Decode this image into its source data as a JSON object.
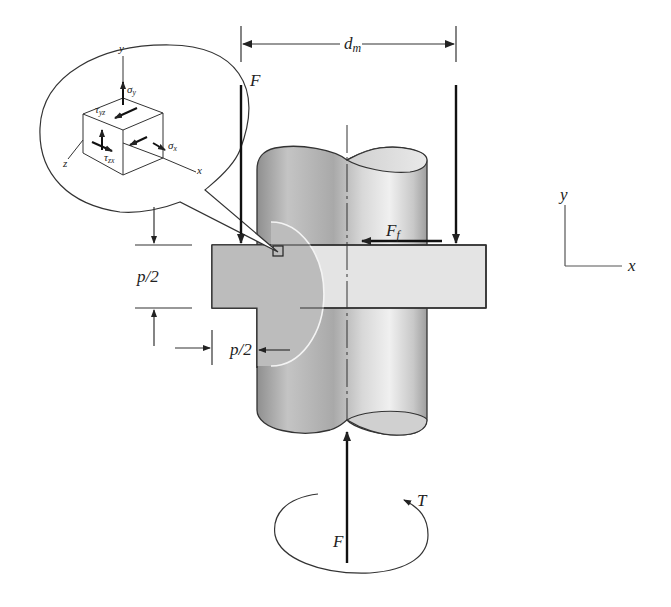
{
  "diagram": {
    "type": "power-screw-thread-stress-element",
    "labels": {
      "pitch_diameter": "d",
      "pitch_diameter_sub": "m",
      "force_top": "F",
      "force_bottom": "F",
      "friction_force": "F",
      "friction_force_sub": "f",
      "torque": "T",
      "pitch_half_vertical": "p/2",
      "pitch_half_horizontal": "p/2",
      "axis_y": "y",
      "axis_x": "x"
    },
    "stress_element": {
      "axis_y": "y",
      "axis_x": "x",
      "axis_z": "z",
      "sigma_y": "σ",
      "sigma_y_sub": "y",
      "sigma_x": "σ",
      "sigma_x_sub": "x",
      "tau_yz": "τ",
      "tau_yz_sub": "yz",
      "tau_zx": "τ",
      "tau_zx_sub": "zx"
    },
    "colors": {
      "line": "#222222",
      "nut_dark": "#b9b9b9",
      "nut_light": "#e2e2e2",
      "cylinder_shade": "#9a9a9a",
      "cylinder_light": "#eeeeee"
    }
  }
}
